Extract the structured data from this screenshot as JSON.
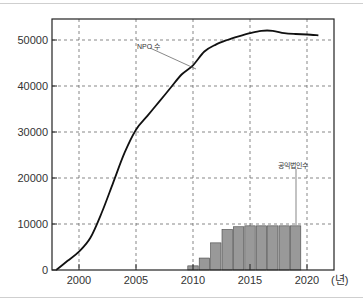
{
  "chart_data": {
    "type": "bar+line",
    "title": "",
    "xlabel": "(년)",
    "ylabel": "",
    "xlim": [
      1997.5,
      2022.5
    ],
    "ylim": [
      0,
      54500
    ],
    "grid": true,
    "x_ticks": [
      2000,
      2005,
      2010,
      2015,
      2020
    ],
    "x_tick_labels": [
      "2000",
      "2005",
      "2010",
      "2015",
      "2020"
    ],
    "y_ticks": [
      0,
      10000,
      20000,
      30000,
      40000,
      50000
    ],
    "y_tick_labels": [
      "0",
      "10000",
      "20000",
      "30000",
      "40000",
      "50000"
    ],
    "series": [
      {
        "name": "NPO 수",
        "type": "line",
        "color": "#111111",
        "x": [
          1998,
          1999,
          2000,
          2001,
          2002,
          2003,
          2004,
          2005,
          2006,
          2007,
          2008,
          2009,
          2010,
          2011,
          2012,
          2013,
          2014,
          2015,
          2016,
          2017,
          2018,
          2019,
          2020,
          2021
        ],
        "values": [
          0,
          2000,
          4000,
          7000,
          12500,
          19000,
          25500,
          30500,
          33500,
          36500,
          39500,
          42500,
          44500,
          47500,
          49000,
          50000,
          50800,
          51500,
          52000,
          52000,
          51500,
          51300,
          51200,
          51000
        ]
      },
      {
        "name": "공익법인수",
        "type": "bar",
        "color": "#999999",
        "x": [
          2010,
          2011,
          2012,
          2013,
          2014,
          2015,
          2016,
          2017,
          2018,
          2019
        ],
        "values": [
          900,
          2600,
          5900,
          8800,
          9400,
          9600,
          9600,
          9600,
          9600,
          9600
        ]
      }
    ],
    "annotations": [
      {
        "text": "NPO 수",
        "target_series": "NPO 수",
        "target_x": 2010
      },
      {
        "text": "공익법인수",
        "target_series": "공익법인수",
        "target_x": 2019
      }
    ],
    "legend": "none (inline annotations)"
  },
  "labels": {
    "x_unit": "(년)",
    "npo_annotation": "NPO 수",
    "public_corp_annotation": "공익법인수"
  }
}
